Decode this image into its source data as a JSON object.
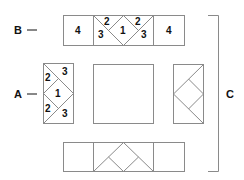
{
  "diagram": {
    "labels": {
      "B": "B",
      "A": "A",
      "C": "C",
      "dash": "—"
    },
    "top_strip_B": {
      "left_square": "4",
      "center": {
        "top_left": "2",
        "bottom_left": "3",
        "middle": "1",
        "top_right": "2",
        "bottom_right": "3"
      },
      "right_square": "4"
    },
    "left_block_A": {
      "top_left": "2",
      "top_right": "3",
      "middle": "1",
      "bottom_left": "2",
      "bottom_right": "3"
    },
    "line_color": "#8a8a8a",
    "text_color": "#111111"
  }
}
